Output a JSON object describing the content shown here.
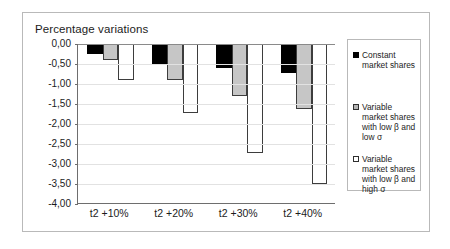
{
  "chart_data": {
    "type": "bar",
    "title": "Percentage variations",
    "xlabel": "",
    "ylabel": "",
    "ylim": [
      -4.0,
      0.0
    ],
    "ytick_labels": [
      "0,00",
      "-0,50",
      "-1,00",
      "-1,50",
      "-2,00",
      "-2,50",
      "-3,00",
      "-3,50",
      "-4,00"
    ],
    "ytick_values": [
      0.0,
      -0.5,
      -1.0,
      -1.5,
      -2.0,
      -2.5,
      -3.0,
      -3.5,
      -4.0
    ],
    "grid": true,
    "legend_position": "right",
    "categories": [
      "t2 +10%",
      "t2 +20%",
      "t2 +30%",
      "t2 +40%"
    ],
    "series": [
      {
        "name": "Constant market shares",
        "fill": "#000000",
        "values": [
          -0.25,
          -0.52,
          -0.6,
          -0.72
        ]
      },
      {
        "name": "Variable market shares with low β and low σ",
        "fill": "#c6c6c6",
        "values": [
          -0.4,
          -0.9,
          -1.3,
          -1.62
        ]
      },
      {
        "name": "Variable market shares with low β and high σ",
        "fill": "#ffffff",
        "values": [
          -0.9,
          -1.72,
          -2.72,
          -3.5
        ]
      }
    ]
  },
  "legend": {
    "items": [
      {
        "label": "Constant market shares"
      },
      {
        "label": "Variable market shares with low β and low σ"
      },
      {
        "label": "Variable market shares with low β and high σ"
      }
    ]
  }
}
